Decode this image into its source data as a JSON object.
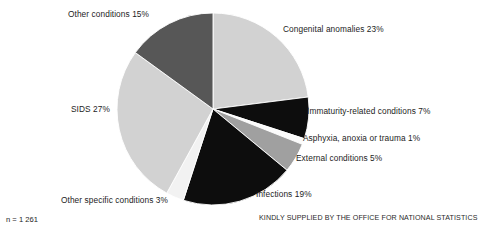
{
  "chart_data": {
    "type": "pie",
    "title": "",
    "subtitle": "",
    "xlabel": "",
    "ylabel": "",
    "legend_position": "callout-labels",
    "grid": false,
    "units": "percent",
    "start_angle_deg": 0,
    "direction": "clockwise",
    "center": {
      "x": 213,
      "y": 109
    },
    "radius": 96,
    "total_n": 1261,
    "categories": [
      "Congenital anomalies",
      "Immaturity-related conditions",
      "Asphyxia, anoxia or trauma",
      "External conditions",
      "Infections",
      "Other specific conditions",
      "SIDS",
      "Other conditions"
    ],
    "values": [
      23,
      7,
      1,
      5,
      19,
      3,
      27,
      15
    ],
    "slices": [
      {
        "name": "Congenital anomalies",
        "value": 23,
        "label": "Congenital anomalies 23%",
        "color": "#d2d2d2",
        "start_deg": 0,
        "end_deg": 82.8
      },
      {
        "name": "Immaturity-related conditions",
        "value": 7,
        "label": "Immaturity-related conditions 7%",
        "color": "#0d0d0d",
        "start_deg": 82.8,
        "end_deg": 108.0
      },
      {
        "name": "Asphyxia, anoxia or trauma",
        "value": 1,
        "label": "Asphyxia, anoxia or trauma 1%",
        "color": "#fbfbfb",
        "start_deg": 108.0,
        "end_deg": 111.6
      },
      {
        "name": "External conditions",
        "value": 5,
        "label": "External conditions 5%",
        "color": "#a0a0a0",
        "start_deg": 111.6,
        "end_deg": 129.6
      },
      {
        "name": "Infections",
        "value": 19,
        "label": "Infections 19%",
        "color": "#0d0d0d",
        "start_deg": 129.6,
        "end_deg": 198.0
      },
      {
        "name": "Other specific conditions",
        "value": 3,
        "label": "Other specific conditions 3%",
        "color": "#f2f2f2",
        "start_deg": 198.0,
        "end_deg": 208.8
      },
      {
        "name": "SIDS",
        "value": 27,
        "label": "SIDS 27%",
        "color": "#d2d2d2",
        "start_deg": 208.8,
        "end_deg": 306.0
      },
      {
        "name": "Other conditions",
        "value": 15,
        "label": "Other conditions 15%",
        "color": "#575757",
        "start_deg": 306.0,
        "end_deg": 360.0
      }
    ],
    "annotations": {
      "sample_size": "n = 1 261",
      "credit": "KINDLY SUPPLIED BY THE OFFICE FOR NATIONAL STATISTICS"
    }
  },
  "labels": {
    "congenital": "Congenital anomalies 23%",
    "immaturity": "Immaturity-related conditions 7%",
    "asphyxia": "Asphyxia, anoxia or trauma 1%",
    "external": "External conditions 5%",
    "infections": "Infections 19%",
    "other_specific": "Other specific conditions 3%",
    "sids": "SIDS 27%",
    "other_conditions": "Other conditions 15%"
  },
  "footer": {
    "sample_size": "n = 1 261",
    "credit": "KINDLY SUPPLIED BY THE OFFICE FOR NATIONAL STATISTICS"
  },
  "colors": {
    "light_grey": "#d2d2d2",
    "mid_grey": "#a0a0a0",
    "dark_grey": "#575757",
    "black": "#0d0d0d",
    "white": "#fbfbfb",
    "background": "#ffffff",
    "text": "#1c1c1c"
  }
}
